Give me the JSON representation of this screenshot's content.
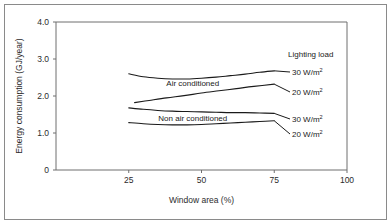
{
  "figure": {
    "background_color": "#ffffff",
    "border_color": "#8a8a8a",
    "axis_color": "#6f6f6f",
    "line_color": "#1a1a1a"
  },
  "chart_data": {
    "type": "line",
    "title": "",
    "xlabel": "Window area (%)",
    "ylabel": "Energy consumption (GJ/year)",
    "xlim": [
      0,
      100
    ],
    "ylim": [
      0,
      4.0
    ],
    "xticks": [
      25,
      50,
      75,
      100
    ],
    "xticklabels": [
      "25",
      "50",
      "75",
      "100"
    ],
    "yticks": [
      0,
      1.0,
      2.0,
      3.0,
      4.0
    ],
    "yticklabels": [
      "0",
      "1.0",
      "2.0",
      "3.0",
      "4.0"
    ],
    "grid": false,
    "legend_position": "right-inline",
    "legend_heading": "Lighting load",
    "group_labels": [
      {
        "text": "Air conditioned",
        "x": 47,
        "y": 2.27
      },
      {
        "text": "Non air conditioned",
        "x": 47,
        "y": 1.33
      }
    ],
    "series": [
      {
        "name": "Air conditioned, 30 W/m2",
        "group": "Air conditioned",
        "lighting_load": "30 W/m²",
        "label": "30 W/m",
        "label_sup": "2",
        "x": [
          25,
          30,
          35,
          40,
          45,
          50,
          55,
          60,
          65,
          70,
          75
        ],
        "y": [
          2.6,
          2.52,
          2.48,
          2.46,
          2.46,
          2.48,
          2.51,
          2.55,
          2.59,
          2.64,
          2.68
        ]
      },
      {
        "name": "Air conditioned, 20 W/m2",
        "group": "Air conditioned",
        "lighting_load": "20 W/m²",
        "label": "20 W/m",
        "label_sup": "2",
        "x": [
          27,
          32,
          38,
          44,
          50,
          56,
          62,
          68,
          75
        ],
        "y": [
          1.82,
          1.88,
          1.95,
          2.01,
          2.08,
          2.14,
          2.2,
          2.26,
          2.32
        ]
      },
      {
        "name": "Non air conditioned, 30 W/m2",
        "group": "Non air conditioned",
        "lighting_load": "30 W/m²",
        "label": "30 W/m",
        "label_sup": "2",
        "x": [
          25,
          30,
          35,
          40,
          45,
          50,
          55,
          60,
          65,
          70,
          75
        ],
        "y": [
          1.68,
          1.64,
          1.61,
          1.59,
          1.58,
          1.57,
          1.56,
          1.55,
          1.55,
          1.54,
          1.53
        ]
      },
      {
        "name": "Non air conditioned, 20 W/m2",
        "group": "Non air conditioned",
        "lighting_load": "20 W/m²",
        "label": "20 W/m",
        "label_sup": "2",
        "x": [
          25,
          30,
          35,
          40,
          45,
          50,
          55,
          60,
          65,
          70,
          75
        ],
        "y": [
          1.28,
          1.25,
          1.23,
          1.22,
          1.22,
          1.23,
          1.25,
          1.27,
          1.29,
          1.31,
          1.33
        ]
      }
    ]
  },
  "legend_entries": [
    {
      "label": "30 W/m",
      "sup": "2",
      "anchor_y": 2.68
    },
    {
      "label": "20 W/m",
      "sup": "2",
      "anchor_y": 2.32
    },
    {
      "label": "30 W/m",
      "sup": "2",
      "anchor_y": 1.53
    },
    {
      "label": "20 W/m",
      "sup": "2",
      "anchor_y": 1.33
    }
  ]
}
